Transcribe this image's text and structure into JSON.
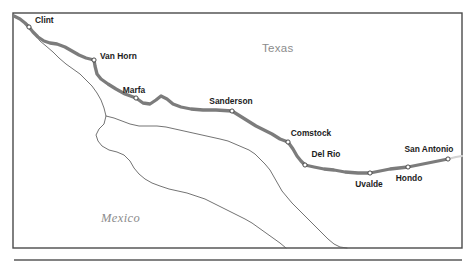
{
  "figure": {
    "frame": {
      "x": 13,
      "y": 13,
      "width": 449,
      "height": 235
    },
    "colors": {
      "frame_stroke": "#4a4a4a",
      "route": "#7c7c7c",
      "route_faint": "#d2d2d2",
      "river": "#5a5a5a",
      "label_text": "#1c1c1c",
      "region_text": "#8c8c8c",
      "background": "#ffffff"
    }
  },
  "regions": [
    {
      "name": "Texas",
      "label": "Texas",
      "x": 262,
      "y": 52,
      "style": "sans-gray"
    },
    {
      "name": "Mexico",
      "label": "Mexico",
      "x": 101,
      "y": 222,
      "style": "serif-italic-gray"
    }
  ],
  "cities": [
    {
      "name": "Clint",
      "label": "Clint",
      "marker_x": 29,
      "marker_y": 27,
      "label_x": 35,
      "label_y": 23,
      "anchor": "start"
    },
    {
      "name": "Van Horn",
      "label": "Van Horn",
      "marker_x": 94,
      "marker_y": 60,
      "label_x": 100,
      "label_y": 59,
      "anchor": "start"
    },
    {
      "name": "Marfa",
      "label": "Marfa",
      "marker_x": 136,
      "marker_y": 98,
      "label_x": 134,
      "label_y": 93,
      "anchor": "middle"
    },
    {
      "name": "Sanderson",
      "label": "Sanderson",
      "marker_x": 232,
      "marker_y": 111,
      "label_x": 231,
      "label_y": 104,
      "anchor": "middle"
    },
    {
      "name": "Comstock",
      "label": "Comstock",
      "marker_x": 288,
      "marker_y": 142,
      "label_x": 311,
      "label_y": 136,
      "anchor": "middle"
    },
    {
      "name": "Del Rio",
      "label": "Del Rio",
      "marker_x": 305,
      "marker_y": 165,
      "label_x": 326,
      "label_y": 157,
      "anchor": "middle"
    },
    {
      "name": "Uvalde",
      "label": "Uvalde",
      "marker_x": 370,
      "marker_y": 173,
      "label_x": 369,
      "label_y": 187,
      "anchor": "middle"
    },
    {
      "name": "Hondo",
      "label": "Hondo",
      "marker_x": 408,
      "marker_y": 167,
      "label_x": 409,
      "label_y": 181,
      "anchor": "middle"
    },
    {
      "name": "San Antonio",
      "label": "San Antonio",
      "marker_x": 448,
      "marker_y": 159,
      "label_x": 429,
      "label_y": 152,
      "anchor": "middle"
    }
  ],
  "route": {
    "name": "rail-route",
    "path": "M 14 16 L 20 19 L 25 23 L 29 27 L 33 32 L 38 37 L 44 41 L 50 43 L 57 44 L 65 47 L 72 51 L 79 55 L 86 58 L 94 60 L 95 66 L 97 74 L 101 79 L 108 84 L 116 89 L 125 94 L 136 98 L 143 103 L 150 104 L 156 100 L 161 96 L 167 99 L 173 104 L 181 107 L 191 109 L 203 110 L 216 110 L 232 111 L 240 116 L 248 121 L 256 126 L 264 130 L 272 134 L 280 139 L 288 142 L 293 149 L 297 156 L 301 161 L 305 165 L 314 167 L 324 169 L 334 170 L 345 172 L 358 173 L 370 173 L 380 171 L 390 169 L 399 168 L 408 167 L 418 165 L 428 163 L 438 161 L 448 159",
    "faint_tail": "M 448 159 L 456 157 L 462 156"
  },
  "river": {
    "name": "rio-grande",
    "path": "M 31 31 L 36 36 L 40 41 L 46 46 L 53 52 L 59 58 L 66 64 L 73 69 L 80 74 L 86 80 L 92 86 L 97 93 L 101 100 L 104 108 L 106 116 L 104 124 L 99 129 L 96 135 L 98 141 L 102 146 L 109 150 L 117 152 L 124 155 L 130 161 L 134 168 L 139 174 L 145 179 L 152 183 L 160 186 L 169 189 L 178 191 L 187 193 L 196 196 L 205 199 L 213 203 L 221 207 L 229 211 L 237 215 L 245 219 L 252 223 L 259 228 L 266 233 L 273 238 L 280 243 L 286 248"
  },
  "river_upper": {
    "name": "rio-grande-bigbend",
    "path": "M 106 116 L 114 118 L 122 121 L 130 124 L 139 126 L 148 126 L 157 126 L 166 127 L 175 129 L 184 131 L 193 133 L 202 135 L 211 137 L 220 139 L 228 141 L 235 144 L 242 147 L 249 150 L 255 154 L 260 159 L 265 164 L 270 170 L 274 177 L 278 184 L 282 191 L 287 197 L 292 203 L 298 209 L 304 215 L 310 221 L 316 227 L 322 233 L 328 239 L 334 244 L 340 247 L 347 248"
  },
  "river_bigbend_loop": {
    "name": "rio-grande-big-bend-loop",
    "path": "M 106 116 L 110 122 L 115 127 L 121 130 L 128 132 L 135 135 L 141 139 L 146 143 L 152 146 L 158 148 L 165 150 L 172 150 L 179 149 L 186 147 L 192 144 L 197 140 L 202 136 L 207 133 L 213 131 L 220 130 L 228 130 L 236 131 L 244 133"
  },
  "bottom_rule": {
    "name": "page-divider",
    "x1": 14,
    "y1": 260,
    "x2": 462,
    "y2": 260
  }
}
